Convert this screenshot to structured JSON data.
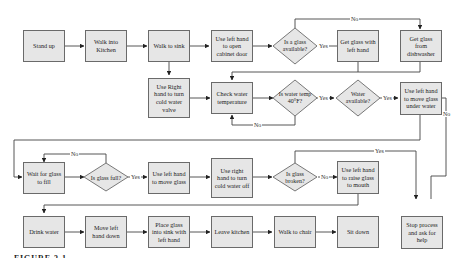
{
  "diagram": {
    "type": "flowchart",
    "nodes": {
      "stand_up": "Stand up",
      "walk_kitchen": "Walk into Kitchen",
      "walk_sink": "Walk to sink",
      "open_cabinet": "Use left hand to open cabinet door",
      "glass_available": "Is a glass available?",
      "get_glass_left": "Get glass with left hand",
      "get_glass_dishwasher": "Get glass from dishwasher",
      "turn_cold_valve": "Use Right hand to turn cold water valve",
      "check_temp": "Check water temperature",
      "water_temp": "Is water temp 40°F?",
      "water_available": "Water available?",
      "move_glass_under": "Use left hand to move glass under water",
      "wait_fill": "Wait for glass to fill",
      "glass_full": "Is glass full?",
      "move_glass": "Use left hand to move glass",
      "turn_water_off": "Use right hand to turn cold water off",
      "glass_broken": "Is glass broken?",
      "raise_glass": "Use left hand to raise glass to mouth",
      "drink": "Drink water",
      "move_hand_down": "Move left hand down",
      "place_glass": "Place glass into sink with left hand",
      "leave_kitchen": "Leave kitchen",
      "walk_chair": "Walk to chair",
      "sit_down": "Sit down",
      "stop_help": "Stop process and ask for help"
    },
    "edge_labels": {
      "glass_no": "No",
      "glass_yes": "Yes",
      "temp_no": "No",
      "temp_yes": "Yes",
      "water_yes": "Yes",
      "water_no": "No",
      "full_no": "No",
      "full_yes": "Yes",
      "broken_yes": "Yes",
      "broken_no": "No"
    },
    "edges": [
      [
        "stand_up",
        "walk_kitchen"
      ],
      [
        "walk_kitchen",
        "walk_sink"
      ],
      [
        "walk_sink",
        "open_cabinet"
      ],
      [
        "walk_sink",
        "turn_cold_valve"
      ],
      [
        "open_cabinet",
        "glass_available"
      ],
      [
        "glass_available",
        "get_glass_left",
        "Yes"
      ],
      [
        "glass_available",
        "get_glass_dishwasher",
        "No"
      ],
      [
        "get_glass_left",
        "check_temp"
      ],
      [
        "get_glass_dishwasher",
        "check_temp"
      ],
      [
        "turn_cold_valve",
        "check_temp"
      ],
      [
        "check_temp",
        "water_temp"
      ],
      [
        "water_temp",
        "check_temp",
        "No"
      ],
      [
        "water_temp",
        "water_available",
        "Yes"
      ],
      [
        "water_available",
        "move_glass_under",
        "Yes"
      ],
      [
        "water_available",
        "stop_help",
        "No"
      ],
      [
        "move_glass_under",
        "wait_fill"
      ],
      [
        "wait_fill",
        "glass_full"
      ],
      [
        "glass_full",
        "wait_fill",
        "No"
      ],
      [
        "glass_full",
        "move_glass",
        "Yes"
      ],
      [
        "move_glass",
        "turn_water_off"
      ],
      [
        "turn_water_off",
        "glass_broken"
      ],
      [
        "glass_broken",
        "stop_help",
        "Yes"
      ],
      [
        "glass_broken",
        "raise_glass",
        "No"
      ],
      [
        "raise_glass",
        "drink"
      ],
      [
        "drink",
        "move_hand_down"
      ],
      [
        "move_hand_down",
        "place_glass"
      ],
      [
        "place_glass",
        "leave_kitchen"
      ],
      [
        "leave_kitchen",
        "walk_chair"
      ],
      [
        "walk_chair",
        "sit_down"
      ]
    ]
  },
  "caption": "FIGURE 3.1"
}
